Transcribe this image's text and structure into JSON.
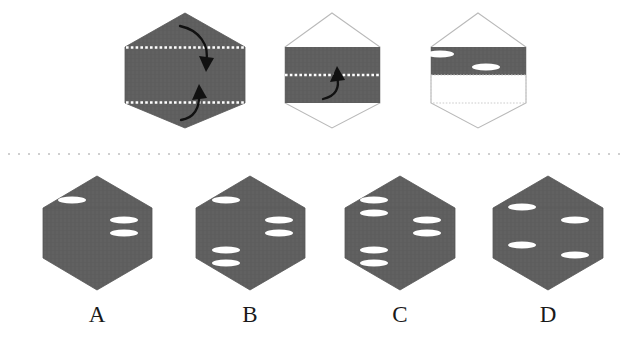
{
  "figure": {
    "kind": "folding-paper-puzzle",
    "colors": {
      "paper_fill": "#5e5e5e",
      "paper_fill_alt": "#636363",
      "outline_stroke": "#b9b9b9",
      "fold_line": "#ffffff",
      "hole_fill": "#ffffff",
      "divider": "#cfcfcf",
      "arrow": "#111111",
      "label_text": "#1a1a1a",
      "background": "#ffffff"
    },
    "divider": {
      "name": "dotted-separator",
      "y": 154,
      "style": "dotted"
    }
  },
  "prompt_row": {
    "name": "folding-sequence",
    "steps": [
      {
        "id": "step-1",
        "state": "unfolded-hexagon",
        "fill": "solid",
        "fold_lines": 2,
        "arrows": [
          {
            "name": "fold-down-arrow",
            "direction": "down"
          },
          {
            "name": "fold-up-arrow",
            "direction": "up"
          }
        ],
        "holes": []
      },
      {
        "id": "step-2",
        "state": "folded-once-band",
        "fill": "band-only",
        "fold_lines": 1,
        "arrows": [
          {
            "name": "fold-up-arrow",
            "direction": "up"
          }
        ],
        "holes": []
      },
      {
        "id": "step-3",
        "state": "folded-twice-punched",
        "fill": "half-band",
        "fold_lines": 0,
        "arrows": [],
        "holes": [
          {
            "name": "punched-hole",
            "cx": 440,
            "cy": 54
          },
          {
            "name": "punched-hole",
            "cx": 486,
            "cy": 67
          }
        ]
      }
    ]
  },
  "options_row": {
    "name": "answer-options",
    "options": [
      {
        "id": "option-a",
        "label": "A",
        "hole_count": 3,
        "holes": [
          {
            "cx": 72,
            "cy": 200
          },
          {
            "cx": 124,
            "cy": 220
          },
          {
            "cx": 124,
            "cy": 233
          }
        ]
      },
      {
        "id": "option-b",
        "label": "B",
        "hole_count": 5,
        "holes": [
          {
            "cx": 226,
            "cy": 200
          },
          {
            "cx": 279,
            "cy": 220
          },
          {
            "cx": 279,
            "cy": 233
          },
          {
            "cx": 226,
            "cy": 250
          },
          {
            "cx": 226,
            "cy": 263
          }
        ]
      },
      {
        "id": "option-c",
        "label": "C",
        "hole_count": 6,
        "holes": [
          {
            "cx": 374,
            "cy": 200
          },
          {
            "cx": 374,
            "cy": 213
          },
          {
            "cx": 427,
            "cy": 220
          },
          {
            "cx": 427,
            "cy": 233
          },
          {
            "cx": 374,
            "cy": 250
          },
          {
            "cx": 374,
            "cy": 263
          }
        ]
      },
      {
        "id": "option-d",
        "label": "D",
        "hole_count": 4,
        "holes": [
          {
            "cx": 522,
            "cy": 207
          },
          {
            "cx": 575,
            "cy": 220
          },
          {
            "cx": 522,
            "cy": 245
          },
          {
            "cx": 575,
            "cy": 255
          }
        ]
      }
    ],
    "label_y": 322
  }
}
